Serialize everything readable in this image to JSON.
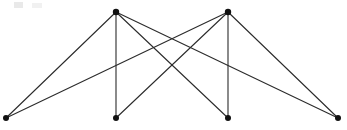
{
  "figure": {
    "background_color": "#ffffff",
    "edge_color": "#2b2b2b",
    "vertex_color": "#111111",
    "width": 347,
    "height": 130
  },
  "graph": {
    "vertex_count": 6,
    "edge_count": 8,
    "vertices": [
      {
        "id": "v1",
        "label": "top-left-apex",
        "x": 116,
        "y": 12,
        "r": 3.2
      },
      {
        "id": "v2",
        "label": "top-right-apex",
        "x": 228,
        "y": 12,
        "r": 3.2
      },
      {
        "id": "v3",
        "label": "bottom-far-left",
        "x": 6,
        "y": 118,
        "r": 3.0
      },
      {
        "id": "v4",
        "label": "bottom-inner-left",
        "x": 116,
        "y": 118,
        "r": 3.0
      },
      {
        "id": "v5",
        "label": "bottom-inner-right",
        "x": 228,
        "y": 118,
        "r": 3.0
      },
      {
        "id": "v6",
        "label": "bottom-far-right",
        "x": 338,
        "y": 118,
        "r": 3.0
      }
    ],
    "edges": [
      {
        "id": "e1",
        "from": "v1",
        "to": "v3",
        "label": "top-left-to-bottom-far-left"
      },
      {
        "id": "e2",
        "from": "v1",
        "to": "v4",
        "label": "top-left-to-bottom-inner-left"
      },
      {
        "id": "e3",
        "from": "v1",
        "to": "v5",
        "label": "top-left-to-bottom-inner-right"
      },
      {
        "id": "e4",
        "from": "v1",
        "to": "v6",
        "label": "top-left-to-bottom-far-right"
      },
      {
        "id": "e5",
        "from": "v2",
        "to": "v3",
        "label": "top-right-to-bottom-far-left"
      },
      {
        "id": "e6",
        "from": "v2",
        "to": "v4",
        "label": "top-right-to-bottom-inner-left"
      },
      {
        "id": "e7",
        "from": "v2",
        "to": "v5",
        "label": "top-right-to-bottom-inner-right"
      },
      {
        "id": "e8",
        "from": "v2",
        "to": "v6",
        "label": "top-right-to-bottom-far-right"
      }
    ]
  },
  "artifact": {
    "label": "faint-top-left-smudge"
  }
}
